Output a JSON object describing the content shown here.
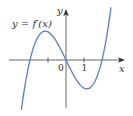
{
  "chart_data": {
    "type": "line",
    "title": "",
    "function_label": "y = f′(x)",
    "xlabel": "x",
    "ylabel": "y",
    "x_ticks": [
      {
        "value": -1,
        "label": ""
      },
      {
        "value": 0,
        "label": "0"
      },
      {
        "value": 1,
        "label": "1"
      }
    ],
    "xlim": [
      -3.1,
      3.3
    ],
    "ylim": [
      -2.6,
      2.8
    ],
    "grid": false,
    "legend": "none",
    "series": [
      {
        "name": "f′(x)",
        "color": "#5b7fb8",
        "roots": [
          -2,
          0,
          2
        ],
        "local_max": {
          "x": -1.15,
          "y": 1.6
        },
        "local_min": {
          "x": 1.15,
          "y": -1.6
        },
        "x": [
          -2.5,
          -2.25,
          -2,
          -1.75,
          -1.5,
          -1.25,
          -1.0,
          -0.75,
          -0.5,
          -0.25,
          0,
          0.25,
          0.5,
          0.75,
          1.0,
          1.25,
          1.5,
          1.75,
          2.0,
          2.25,
          2.5
        ],
        "y": [
          -1.46,
          -0.73,
          0.0,
          0.82,
          1.31,
          1.52,
          1.5,
          1.29,
          0.94,
          0.49,
          0.0,
          -0.49,
          -0.94,
          -1.29,
          -1.5,
          -1.52,
          -1.31,
          -0.82,
          0.0,
          0.73,
          1.46
        ]
      }
    ]
  },
  "labels": {
    "function": "y = f′(x)",
    "x_axis": "x",
    "y_axis": "y",
    "origin": "0",
    "tick_one": "1"
  },
  "colors": {
    "curve": "#5b7fb8",
    "axis": "#555555",
    "text": "#333333"
  }
}
